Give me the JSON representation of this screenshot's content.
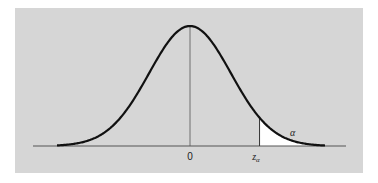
{
  "figure": {
    "background_color": "#d6d6d6",
    "curve_color": "#111111",
    "shade_color": "#ffffff",
    "axis_color": "#444444"
  },
  "labels": {
    "mean": "0",
    "critical_value": "z",
    "critical_subscript": "α",
    "tail_area": "α"
  },
  "chart_data": {
    "type": "area",
    "title": "",
    "xlabel": "",
    "ylabel": "",
    "x_ticks": [
      "0",
      "z_α"
    ],
    "distribution": {
      "name": "standard normal",
      "mean": 0,
      "sd": 1
    },
    "x_range": [
      -3.3,
      3.3
    ],
    "critical_value_z": 1.7,
    "shaded_region": {
      "from": "z_α",
      "to": "+∞",
      "area_label": "α"
    },
    "grid": false,
    "legend": null
  }
}
